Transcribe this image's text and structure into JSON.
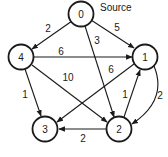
{
  "graph": {
    "source_label": "Source",
    "nodes": [
      {
        "id": "0",
        "label": "0",
        "x": 81,
        "y": 14
      },
      {
        "id": "1",
        "label": "1",
        "x": 145,
        "y": 57
      },
      {
        "id": "2",
        "label": "2",
        "x": 119,
        "y": 129
      },
      {
        "id": "3",
        "label": "3",
        "x": 45,
        "y": 129
      },
      {
        "id": "4",
        "label": "4",
        "x": 21,
        "y": 57
      }
    ],
    "edges": [
      {
        "from": "0",
        "to": "4",
        "weight": "2"
      },
      {
        "from": "0",
        "to": "1",
        "weight": "5"
      },
      {
        "from": "0",
        "to": "2",
        "weight": "3"
      },
      {
        "from": "4",
        "to": "1",
        "weight": "6"
      },
      {
        "from": "4",
        "to": "2",
        "weight": "10"
      },
      {
        "from": "4",
        "to": "3",
        "weight": "1"
      },
      {
        "from": "1",
        "to": "3",
        "weight": "6"
      },
      {
        "from": "2",
        "to": "1",
        "weight": "1"
      },
      {
        "from": "1",
        "to": "2",
        "weight": "2"
      },
      {
        "from": "2",
        "to": "3",
        "weight": "2"
      }
    ]
  }
}
